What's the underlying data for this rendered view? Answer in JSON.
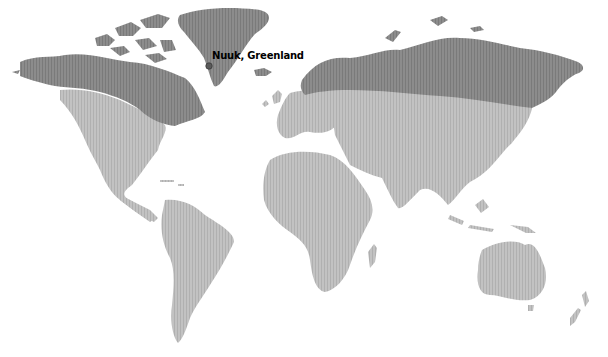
{
  "map": {
    "type": "world-choropleth",
    "projection": "miller-like",
    "colors": {
      "background": "#ffffff",
      "region_north": "#8a8a8a",
      "region_rest": "#bdbdbd",
      "stripe": "#a9a9a9"
    },
    "regions": [
      {
        "name": "northern-high-latitude",
        "color_key": "region_north",
        "covers": [
          "Alaska",
          "Canada (north)",
          "Greenland",
          "Scandinavia (north)",
          "Russia",
          "Siberia"
        ]
      },
      {
        "name": "rest-of-world",
        "color_key": "region_rest",
        "covers": [
          "United States",
          "Central America",
          "South America",
          "Europe",
          "Africa",
          "Middle East",
          "Asia",
          "Oceania"
        ]
      }
    ],
    "markers": [
      {
        "label": "Nuuk, Greenland",
        "x": 208,
        "y": 66
      }
    ]
  }
}
